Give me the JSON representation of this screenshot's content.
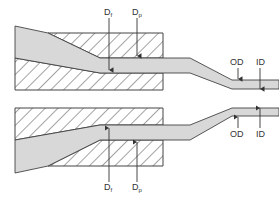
{
  "diagram": {
    "type": "tube extrusion die cross-section",
    "colors": {
      "background": "#ffffff",
      "outline": "#444444",
      "hatch": "#555555",
      "melt_fill": "#d8d8d8"
    },
    "labels": {
      "top_df": {
        "main": "D",
        "sub": "f"
      },
      "top_dp": {
        "main": "D",
        "sub": "p"
      },
      "bottom_df": {
        "main": "D",
        "sub": "f"
      },
      "bottom_dp": {
        "main": "D",
        "sub": "p"
      },
      "top_od": "OD",
      "top_id": "ID",
      "bottom_od": "OD",
      "bottom_id": "ID"
    }
  }
}
